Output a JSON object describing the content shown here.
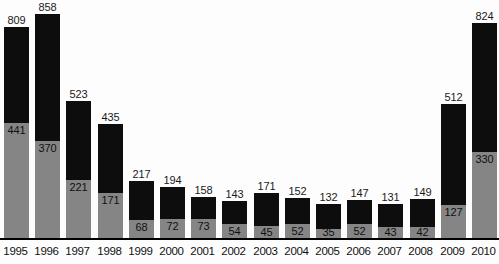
{
  "chart_data": {
    "type": "bar",
    "subtype": "stacked-bar",
    "title": "",
    "subtitle": "",
    "xlabel": "",
    "ylabel": "",
    "grid": false,
    "legend": false,
    "legend_position": "none",
    "ylim": [
      0,
      900
    ],
    "categories": [
      "1995",
      "1996",
      "1997",
      "1998",
      "1999",
      "2000",
      "2001",
      "2002",
      "2003",
      "2004",
      "2005",
      "2006",
      "2007",
      "2008",
      "2009",
      "2010"
    ],
    "series": [
      {
        "name": "lower-segment",
        "color": "#858585",
        "values": [
          441,
          370,
          221,
          171,
          68,
          72,
          73,
          54,
          45,
          52,
          35,
          52,
          43,
          42,
          127,
          330
        ]
      },
      {
        "name": "upper-segment",
        "color": "#0d0d0d",
        "values": [
          368,
          488,
          302,
          264,
          149,
          122,
          85,
          89,
          126,
          100,
          97,
          95,
          88,
          107,
          385,
          494
        ]
      }
    ],
    "totals": [
      809,
      858,
      523,
      435,
      217,
      194,
      158,
      143,
      171,
      152,
      132,
      147,
      131,
      149,
      512,
      824
    ],
    "total_labels": [
      "809",
      "858",
      "523",
      "435",
      "217",
      "194",
      "158",
      "143",
      "171",
      "152",
      "132",
      "147",
      "131",
      "149",
      "512",
      "824"
    ],
    "inner_labels": [
      "441",
      "370",
      "221",
      "171",
      "68",
      "72",
      "73",
      "54",
      "45",
      "52",
      "35",
      "52",
      "43",
      "42",
      "127",
      "330"
    ],
    "tick_labels": [
      "1995",
      "1996",
      "1997",
      "1998",
      "1999",
      "2000",
      "2001",
      "2002",
      "2003",
      "2004",
      "2005",
      "2006",
      "2007",
      "2008",
      "2009",
      "2010"
    ],
    "colors": {
      "upper": "#0d0d0d",
      "lower": "#858585",
      "background": "#fdfdfd",
      "axis": "#000000",
      "text": "#111111"
    }
  }
}
